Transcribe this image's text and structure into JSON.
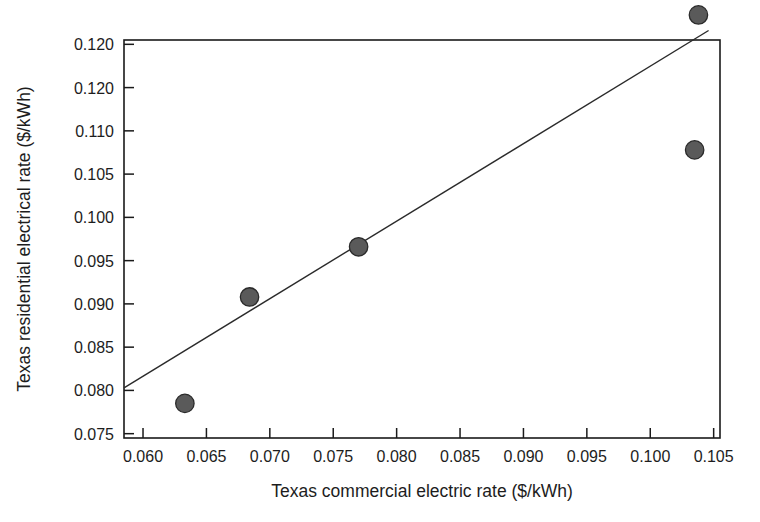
{
  "chart_data": {
    "type": "scatter",
    "title": "",
    "xlabel": "Texas commercial electric rate ($/kWh)",
    "ylabel": "Texas residential electrical rate ($/kWh)",
    "xlim": [
      0.0585,
      0.1055
    ],
    "ylim": [
      0.0745,
      0.1205
    ],
    "grid": false,
    "legend": null,
    "xticks": [
      0.06,
      0.065,
      0.07,
      0.075,
      0.08,
      0.085,
      0.09,
      0.095,
      0.1,
      0.105
    ],
    "xtick_labels": [
      "0.060",
      "0.065",
      "0.070",
      "0.075",
      "0.080",
      "0.085",
      "0.090",
      "0.095",
      "0.100",
      "0.105"
    ],
    "yticks": [
      0.075,
      0.08,
      0.085,
      0.09,
      0.095,
      0.1,
      0.105,
      0.11,
      0.115,
      0.12
    ],
    "ytick_labels": [
      "0.075",
      "0.080",
      "0.085",
      "0.090",
      "0.095",
      "0.100",
      "0.105",
      "0.110",
      "0.120",
      "0.120"
    ],
    "points": [
      {
        "x": 0.0633,
        "y": 0.0785
      },
      {
        "x": 0.0684,
        "y": 0.0908
      },
      {
        "x": 0.077,
        "y": 0.0966
      },
      {
        "x": 0.1035,
        "y": 0.1078
      },
      {
        "x": 0.1038,
        "y": 0.1234
      }
    ],
    "series": [
      {
        "name": "Texas rates",
        "marker": "filled-circle",
        "marker_color": "#5a5a5a",
        "marker_edge_color": "#2a2a2a",
        "x": [
          0.0633,
          0.0684,
          0.077,
          0.1035,
          0.1038
        ],
        "values": [
          0.0785,
          0.0908,
          0.0966,
          0.1078,
          0.1234
        ]
      }
    ],
    "trendline": {
      "type": "linear-fit",
      "color": "#2b2b2b",
      "x_start": 0.0585,
      "y_start": 0.0803,
      "x_end": 0.1046,
      "y_end": 0.1216
    }
  },
  "axes": {
    "x_title": "Texas commercial electric rate ($/kWh)",
    "y_title": "Texas residential electrical rate ($/kWh)"
  }
}
